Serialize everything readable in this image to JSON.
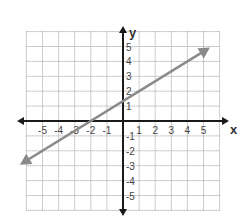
{
  "chart_data": {
    "type": "line",
    "title": "",
    "xlabel": "x",
    "ylabel": "y",
    "xlim": [
      -6,
      6
    ],
    "ylim": [
      -6,
      6
    ],
    "grid": true,
    "x_ticks": [
      -5,
      -4,
      -3,
      -2,
      -1,
      1,
      2,
      3,
      4,
      5
    ],
    "y_ticks": [
      -5,
      -4,
      -3,
      -2,
      -1,
      1,
      2,
      3,
      4,
      5
    ],
    "x_tick_labels": [
      "-5",
      "-4",
      "-3",
      "-2",
      "-1",
      "1",
      "2",
      "3",
      "4",
      "5"
    ],
    "y_tick_labels": [
      "-5",
      "-4",
      "-3",
      "-2",
      "-1",
      "1",
      "2",
      "3",
      "4",
      "5"
    ],
    "series": [
      {
        "name": "line",
        "equation": "y = (2/3)x + 4/3",
        "slope": 0.667,
        "y_intercept": 1.333,
        "x_intercept": -2,
        "points": [
          [
            -6.4,
            -2.93
          ],
          [
            -2,
            0
          ],
          [
            1,
            2
          ],
          [
            4,
            4
          ],
          [
            5.4,
            4.93
          ]
        ],
        "arrows": "both ends",
        "color": "#8a8a8a"
      }
    ]
  },
  "style": {
    "axis_color": "#1a1a1a",
    "grid_color": "#9a9a9a",
    "line_color": "#8a8a8a"
  }
}
